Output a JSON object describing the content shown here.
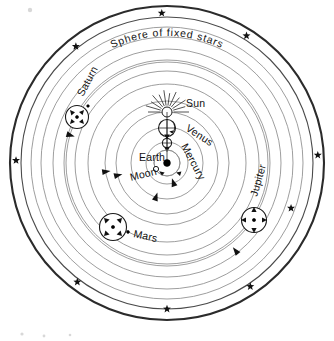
{
  "figure": {
    "title": "Sphere of fixed stars",
    "kind": "geocentric-cosmology-diagram",
    "background_color": "#ffffff",
    "ink_color": "#111111",
    "orbit_color": "#8d8d8d",
    "sphere_color": "#2b2b2b",
    "center": {
      "x": 167,
      "y": 163
    }
  },
  "labels": {
    "sphere_of_fixed_stars": "Sphere of fixed stars",
    "sun": "Sun",
    "venus": "Venus",
    "mercury": "Mercury",
    "earth": "Earth",
    "moon": "Moon",
    "mars": "Mars",
    "jupiter": "Jupiter",
    "saturn": "Saturn"
  },
  "bodies": [
    {
      "name": "Earth",
      "label": "Earth",
      "type": "center-body",
      "marker": "filled-dot",
      "x": 167,
      "y": 163,
      "radius": 3.4,
      "label_x": 140,
      "label_y": 161,
      "label_rotation": 0,
      "has_epicycle": false
    },
    {
      "name": "Moon",
      "label": "Moon",
      "type": "satellite",
      "marker": "open-circle",
      "orbit_radius": 13,
      "label_x": 131,
      "label_y": 181,
      "label_rotation": -14,
      "has_epicycle": false
    },
    {
      "name": "Mercury",
      "label": "Mercury",
      "type": "inferior-planet",
      "marker": "open-circle",
      "x": 167,
      "y": 143,
      "radius": 4.0,
      "label_x": 181,
      "label_y": 146,
      "label_rotation": 62,
      "has_epicycle": true,
      "epicycle_radius": 8
    },
    {
      "name": "Venus",
      "label": "Venus",
      "type": "inferior-planet",
      "marker": "open-circle",
      "x": 167,
      "y": 128,
      "radius": 7.5,
      "label_x": 185,
      "label_y": 130,
      "label_rotation": 33,
      "has_epicycle": true,
      "epicycle_radius": 9
    },
    {
      "name": "Sun",
      "label": "Sun",
      "type": "luminary",
      "marker": "rayed-open-circle",
      "x": 167,
      "y": 112,
      "radius": 5.0,
      "ray_count": 12,
      "label_x": 186,
      "label_y": 107,
      "label_rotation": 0,
      "has_epicycle": false
    },
    {
      "name": "Mars",
      "label": "Mars",
      "type": "superior-planet",
      "marker": "epicycle-with-arrows",
      "x": 113,
      "y": 227,
      "radius": 13.5,
      "label_x": 133,
      "label_y": 236,
      "label_rotation": 12,
      "has_epicycle": true,
      "epicycle_arrows": 4
    },
    {
      "name": "Jupiter",
      "label": "Jupiter",
      "type": "superior-planet",
      "marker": "epicycle-with-arrows",
      "x": 254,
      "y": 220,
      "radius": 12.5,
      "label_x": 257,
      "label_y": 197,
      "label_rotation": -74,
      "has_epicycle": true,
      "epicycle_arrows": 4
    },
    {
      "name": "Saturn",
      "label": "Saturn",
      "type": "superior-planet",
      "marker": "epicycle-with-arrows",
      "x": 77,
      "y": 117,
      "radius": 11.5,
      "label_x": 83,
      "label_y": 97,
      "label_rotation": -62,
      "has_epicycle": true,
      "epicycle_arrows": 4
    }
  ],
  "orbits": [
    {
      "name": "moon-orbit",
      "radius": 13,
      "style": "thin"
    },
    {
      "name": "mercury-orbit",
      "radius": 21,
      "style": "thin"
    },
    {
      "name": "venus-orbit",
      "radius": 36,
      "style": "thin"
    },
    {
      "name": "sun-orbit",
      "radius": 51,
      "style": "thin"
    },
    {
      "name": "orbit-5",
      "radius": 62,
      "style": "thin"
    },
    {
      "name": "mars-orbit",
      "radius": 79,
      "style": "thin"
    },
    {
      "name": "orbit-7",
      "radius": 92,
      "style": "thin"
    },
    {
      "name": "jupiter-orbit",
      "radius": 103,
      "style": "thin"
    },
    {
      "name": "orbit-9",
      "radius": 114,
      "style": "thin"
    },
    {
      "name": "saturn-orbit",
      "radius": 101,
      "style": "thin"
    },
    {
      "name": "orbit-11",
      "radius": 126,
      "style": "thin"
    },
    {
      "name": "orbit-12",
      "radius": 136,
      "style": "thin"
    },
    {
      "name": "star-band-inner",
      "radius": 146,
      "style": "medium"
    },
    {
      "name": "sphere-of-fixed-stars",
      "radius": 157,
      "style": "thick"
    }
  ],
  "stars": [
    {
      "name": "star-n",
      "angle_deg": 268,
      "radius": 150
    },
    {
      "name": "star-nne",
      "angle_deg": 302,
      "radius": 150
    },
    {
      "name": "star-nnw",
      "angle_deg": 232,
      "radius": 148
    },
    {
      "name": "star-e",
      "angle_deg": 357,
      "radius": 151
    },
    {
      "name": "star-w",
      "angle_deg": 181,
      "radius": 151
    },
    {
      "name": "star-sse",
      "angle_deg": 56,
      "radius": 149
    },
    {
      "name": "star-ssw",
      "angle_deg": 127,
      "radius": 149
    },
    {
      "name": "star-s",
      "angle_deg": 90,
      "radius": 146
    },
    {
      "name": "star-jupiter-outer",
      "angle_deg": 20,
      "radius": 132
    }
  ],
  "direction_arrows": [
    {
      "name": "arrow-venus-orbit",
      "angle_deg": 108,
      "radius": 36
    },
    {
      "name": "arrow-sun-orbit",
      "angle_deg": 166,
      "radius": 51
    },
    {
      "name": "arrow-orbit-5",
      "angle_deg": 172,
      "radius": 62
    },
    {
      "name": "arrow-mars-orbit",
      "angle_deg": 126,
      "radius": 79
    },
    {
      "name": "arrow-saturn-orbit",
      "angle_deg": 196,
      "radius": 101
    },
    {
      "name": "arrow-jupiter-orbit",
      "angle_deg": 52,
      "radius": 112
    },
    {
      "name": "arrow-mercury-orbit",
      "angle_deg": 72,
      "radius": 21
    }
  ]
}
